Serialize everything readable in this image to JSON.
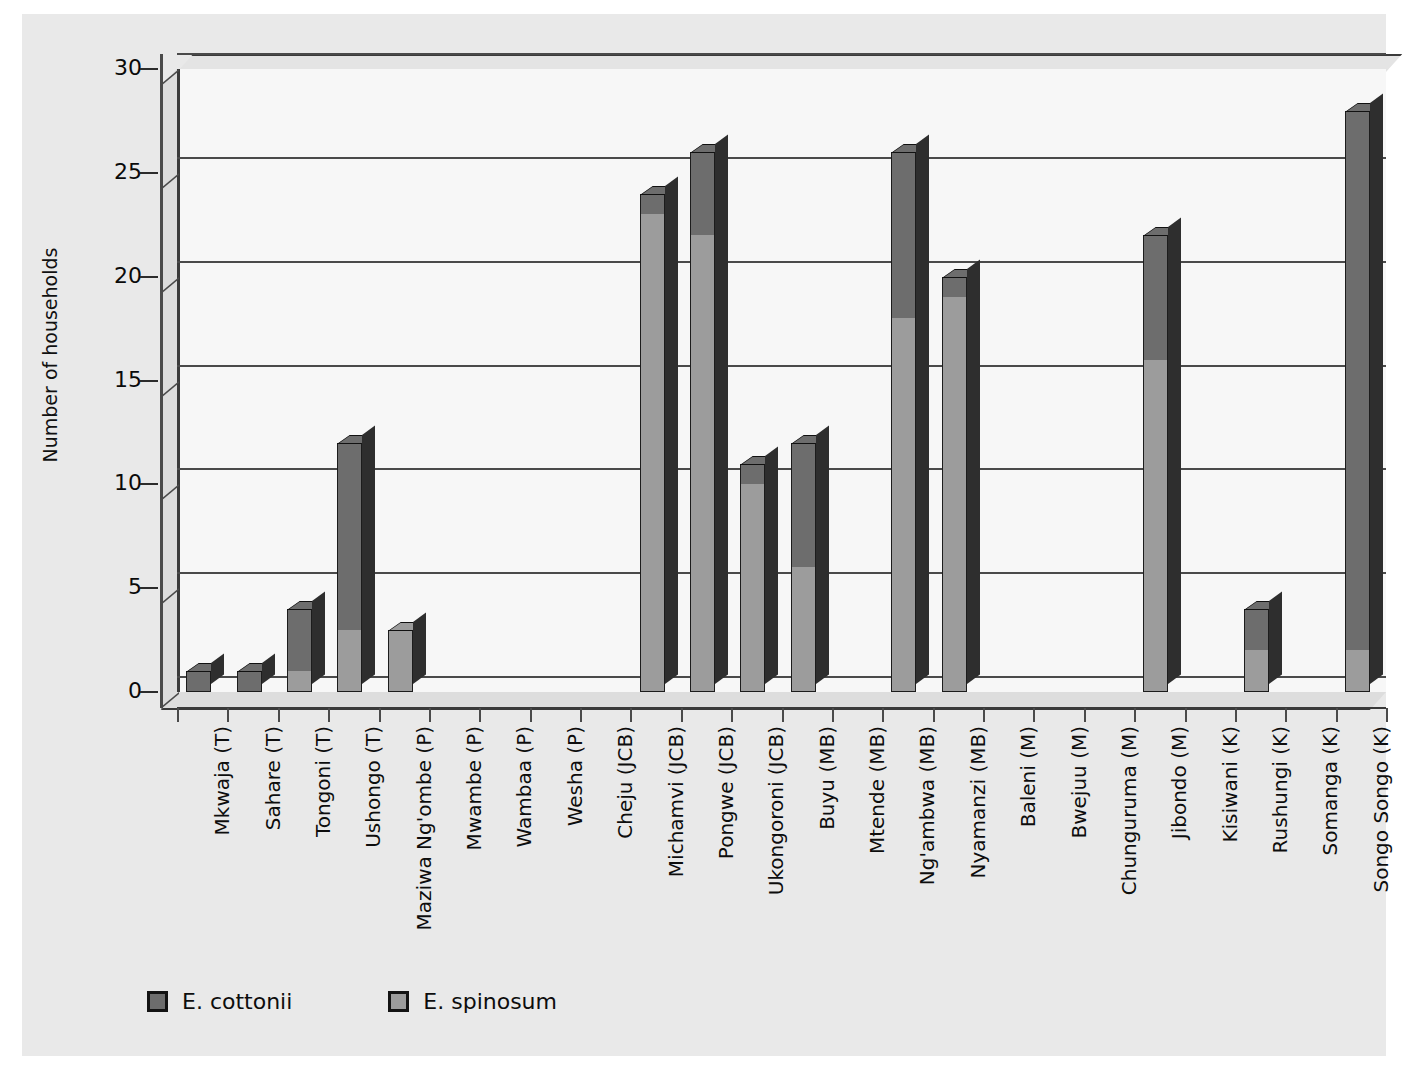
{
  "chart_data": {
    "type": "bar",
    "subtype": "stacked-column-3d",
    "title": "",
    "xlabel": "",
    "ylabel": "Number of households",
    "ylim": [
      0,
      30
    ],
    "yticks": [
      0,
      5,
      10,
      15,
      20,
      25,
      30
    ],
    "grid": true,
    "legend_position": "bottom-left",
    "categories": [
      "Mkwaja (T)",
      "Sahare (T)",
      "Tongoni (T)",
      "Ushongo (T)",
      "Maziwa Ng'ombe (P)",
      "Mwambe (P)",
      "Wambaa (P)",
      "Wesha (P)",
      "Cheju (JCB)",
      "Michamvi (JCB)",
      "Pongwe (JCB)",
      "Ukongoroni (JCB)",
      "Buyu (MB)",
      "Mtende (MB)",
      "Ng'ambwa (MB)",
      "Nyamanzi (MB)",
      "Baleni (M)",
      "Bwejuu (M)",
      "Chunguruma (M)",
      "Jibondo (M)",
      "Kisiwani (K)",
      "Rushungi (K)",
      "Somanga (K)",
      "Songo Songo (K)"
    ],
    "series": [
      {
        "name": "E. spinosum",
        "color": "#9c9c9c",
        "values": [
          0,
          0,
          1,
          3,
          3,
          0,
          0,
          0,
          0,
          23,
          22,
          10,
          6,
          0,
          18,
          19,
          0,
          0,
          0,
          16,
          0,
          2,
          0,
          2
        ]
      },
      {
        "name": "E. cottonii",
        "color": "#6d6d6d",
        "values": [
          1,
          1,
          3,
          9,
          0,
          0,
          0,
          0,
          0,
          1,
          4,
          1,
          6,
          0,
          8,
          1,
          0,
          0,
          0,
          6,
          0,
          2,
          0,
          26
        ]
      }
    ],
    "totals": [
      1,
      1,
      4,
      12,
      3,
      0,
      0,
      0,
      0,
      24,
      26,
      11,
      12,
      0,
      26,
      20,
      0,
      0,
      0,
      22,
      0,
      4,
      0,
      28
    ]
  },
  "legend": {
    "items": [
      {
        "label": "E. cottonii",
        "color": "#6d6d6d"
      },
      {
        "label": "E. spinosum",
        "color": "#9c9c9c"
      }
    ]
  },
  "colors": {
    "page_background": "#ffffff",
    "canvas_background": "#e9e9e9",
    "plot_background": "#f7f7f7",
    "axis": "#3a3a3a",
    "gridline": "#4a4a4a",
    "text": "#0d0d0d",
    "cottonii": "#6d6d6d",
    "spinosum": "#9c9c9c"
  }
}
